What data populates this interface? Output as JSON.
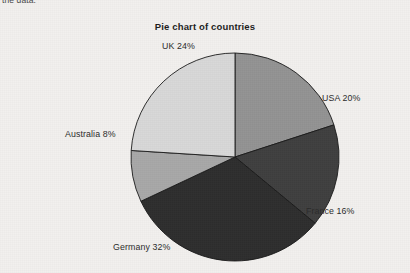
{
  "document": {
    "body_text_fragment": "the data."
  },
  "chart_data": {
    "type": "pie",
    "title": "Pie chart of countries",
    "xlabel": "",
    "ylabel": "",
    "legend_position": "none",
    "grid": false,
    "labels_on_slices": false,
    "start_angle_deg": 0,
    "direction": "clockwise",
    "center": {
      "x": 235,
      "y": 157
    },
    "radius": 104,
    "categories": [
      "USA",
      "France",
      "Germany",
      "Australia",
      "UK"
    ],
    "values": [
      20,
      16,
      32,
      8,
      24
    ],
    "unit": "%",
    "total": 100,
    "slices": [
      {
        "name": "USA",
        "value": 20,
        "label": "USA 20%",
        "color": "#939393",
        "start_deg": 0,
        "end_deg": 72,
        "label_x": 322,
        "label_y": 93
      },
      {
        "name": "France",
        "value": 16,
        "label": "France 16%",
        "color": "#3f3f3f",
        "start_deg": 72,
        "end_deg": 129.6,
        "label_x": 306,
        "label_y": 206
      },
      {
        "name": "Germany",
        "value": 32,
        "label": "Germany 32%",
        "color": "#2e2e2e",
        "start_deg": 129.6,
        "end_deg": 244.8,
        "label_x": 113,
        "label_y": 242
      },
      {
        "name": "Australia",
        "value": 8,
        "label": "Australia 8%",
        "color": "#a8a8a8",
        "start_deg": 244.8,
        "end_deg": 273.6,
        "label_x": 65,
        "label_y": 129
      },
      {
        "name": "UK",
        "value": 24,
        "label": "UK 24%",
        "color": "#d8d8d8",
        "start_deg": 273.6,
        "end_deg": 360,
        "label_x": 162,
        "label_y": 41
      }
    ],
    "edge_color": "#1a1a1a",
    "background_color": "#f2f0ee"
  }
}
